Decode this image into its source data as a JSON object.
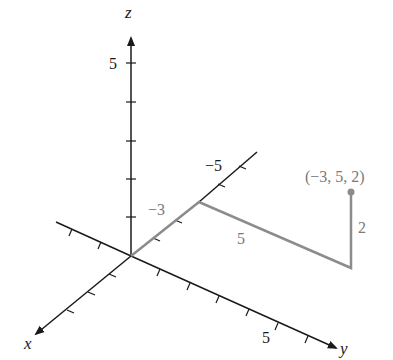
{
  "diagram": {
    "type": "3d-coordinate-axes",
    "axes": {
      "x": {
        "label": "x"
      },
      "y": {
        "label": "y",
        "tick_label": "5"
      },
      "z": {
        "label": "z",
        "tick_label": "5"
      },
      "neg_x_tick_label": "−5"
    },
    "path_labels": {
      "x_segment": "−3",
      "y_segment": "5",
      "z_segment": "2"
    },
    "point": {
      "label": "(−3, 5, 2)",
      "coords": [
        -3,
        5,
        2
      ]
    },
    "colors": {
      "axis": "#1a1a1a",
      "path": "#8c8c8c",
      "path_label": "#7a7a7a",
      "point": "#8c8c8c"
    }
  }
}
